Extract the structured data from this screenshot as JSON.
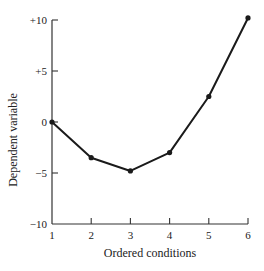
{
  "chart_data": {
    "type": "line",
    "title": "",
    "xlabel": "Ordered conditions",
    "ylabel": "Dependent variable",
    "x": [
      1,
      2,
      3,
      4,
      5,
      6
    ],
    "categories": [
      "1",
      "2",
      "3",
      "4",
      "5",
      "6"
    ],
    "series": [
      {
        "name": "Dependent variable",
        "values": [
          0,
          -3.5,
          -4.8,
          -3,
          2.5,
          10.2
        ]
      }
    ],
    "ylim": [
      -10,
      10
    ],
    "xlim": [
      1,
      6
    ],
    "yticks": [
      {
        "value": 10,
        "label": "+10"
      },
      {
        "value": 5,
        "label": "+5"
      },
      {
        "value": 0,
        "label": "0"
      },
      {
        "value": -5,
        "label": "−5"
      },
      {
        "value": -10,
        "label": "−10"
      }
    ],
    "xticks": [
      {
        "value": 1,
        "label": "1"
      },
      {
        "value": 2,
        "label": "2"
      },
      {
        "value": 3,
        "label": "3"
      },
      {
        "value": 4,
        "label": "4"
      },
      {
        "value": 5,
        "label": "5"
      },
      {
        "value": 6,
        "label": "6"
      }
    ],
    "grid": false,
    "legend": null,
    "line_color": "#1a1a1a"
  }
}
